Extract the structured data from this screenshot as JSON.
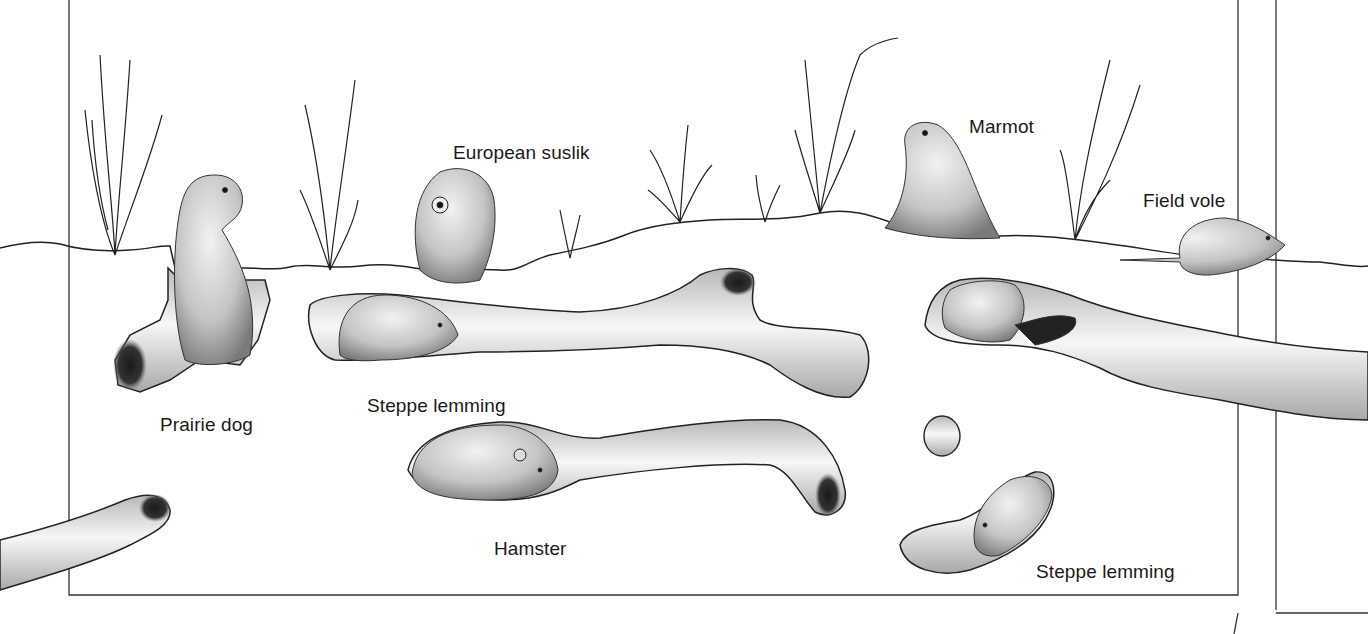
{
  "illustration": {
    "subject": "burrowing-rodents-cross-section",
    "colors": {
      "background": "#ffffff",
      "ink": "#1a1a1a",
      "burrow_light": "#f4f4f4",
      "burrow_mid": "#c8c8c8",
      "burrow_dark": "#1e1e1e"
    }
  },
  "labels": {
    "european_suslik": "European suslik",
    "marmot": "Marmot",
    "field_vole": "Field vole",
    "prairie_dog": "Prairie dog",
    "steppe_lemming_upper": "Steppe lemming",
    "hamster": "Hamster",
    "steppe_lemming_lower": "Steppe lemming"
  }
}
